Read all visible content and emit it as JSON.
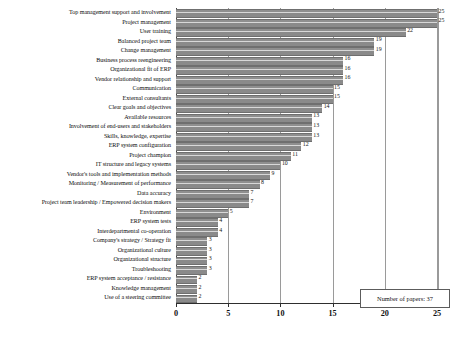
{
  "chart_data": {
    "type": "bar",
    "orientation": "horizontal",
    "title": "",
    "xlabel": "",
    "ylabel": "",
    "xlim": [
      0,
      25
    ],
    "xticks": [
      0,
      5,
      10,
      15,
      20,
      25
    ],
    "grid": true,
    "legend_position": "bottom-right",
    "annotation": "Number of papers: 37",
    "bar_color": "#8a8a8a",
    "categories": [
      "Top management support and involvement",
      "Project management",
      "User training",
      "Balanced project team",
      "Change management",
      "Business process reengineering",
      "Organizational fit of ERP",
      "Vendor relationship and support",
      "Communication",
      "External consultants",
      "Clear goals and objectives",
      "Available resources",
      "Involvement of end-users and stakeholders",
      "Skills, knowledge, expertise",
      "ERP system configuration",
      "Project champion",
      "IT structure and legacy systems",
      "Vendor's tools and implementation methods",
      "Monitoring / Measurement of performance",
      "Data accuracy",
      "Project team leadership / Empowered decision makers",
      "Environment",
      "ERP system tests",
      "Interdepartmental co-operation",
      "Company's strategy / Strategy fit",
      "Organizational culture",
      "Organizational structure",
      "Troubleshooting",
      "ERP system acceptance / resistance",
      "Knowledge management",
      "Use of a steering committee"
    ],
    "values": [
      25,
      25,
      22,
      19,
      19,
      16,
      16,
      16,
      15,
      15,
      14,
      13,
      13,
      13,
      12,
      11,
      10,
      9,
      8,
      7,
      7,
      5,
      4,
      4,
      3,
      3,
      3,
      3,
      2,
      2,
      2
    ]
  }
}
